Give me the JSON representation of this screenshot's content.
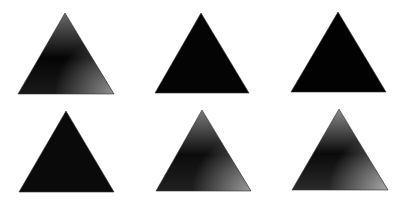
{
  "figure": {
    "layout": {
      "rows": 2,
      "cols": 3
    },
    "panels": [
      {
        "id": "panel-1",
        "row": 1,
        "col": 1,
        "apex": [
          65,
          13
        ],
        "left": [
          18,
          94
        ],
        "right": [
          114,
          94
        ],
        "shading": "gradient",
        "colors": {
          "top": "#6a6a6a",
          "mid": "#050505",
          "bottom_right": "#8f8f8f",
          "bottom_left": "#1a1a1a"
        }
      },
      {
        "id": "panel-2",
        "row": 1,
        "col": 2,
        "apex": [
          201,
          13
        ],
        "left": [
          155,
          93
        ],
        "right": [
          249,
          93
        ],
        "shading": "solid",
        "colors": {
          "fill": "#040404"
        }
      },
      {
        "id": "panel-3",
        "row": 1,
        "col": 3,
        "apex": [
          338,
          12
        ],
        "left": [
          291,
          92
        ],
        "right": [
          386,
          92
        ],
        "shading": "solid",
        "colors": {
          "fill": "#020202"
        }
      },
      {
        "id": "panel-4",
        "row": 2,
        "col": 1,
        "apex": [
          66,
          111
        ],
        "left": [
          19,
          192
        ],
        "right": [
          114,
          192
        ],
        "shading": "solid",
        "colors": {
          "fill": "#0a0a0a"
        }
      },
      {
        "id": "panel-5",
        "row": 2,
        "col": 2,
        "apex": [
          202,
          110
        ],
        "left": [
          156,
          191
        ],
        "right": [
          251,
          191
        ],
        "shading": "gradient",
        "colors": {
          "top": "#7a7a7a",
          "mid": "#0c0c0c",
          "bottom_right": "#9a9a9a",
          "bottom_left": "#202020"
        }
      },
      {
        "id": "panel-6",
        "row": 2,
        "col": 3,
        "apex": [
          339,
          109
        ],
        "left": [
          292,
          190
        ],
        "right": [
          388,
          190
        ],
        "shading": "gradient",
        "colors": {
          "top": "#8a8a8a",
          "mid": "#0a0a0a",
          "bottom_right": "#a8a8a8",
          "bottom_left": "#2a2a2a"
        }
      }
    ]
  }
}
